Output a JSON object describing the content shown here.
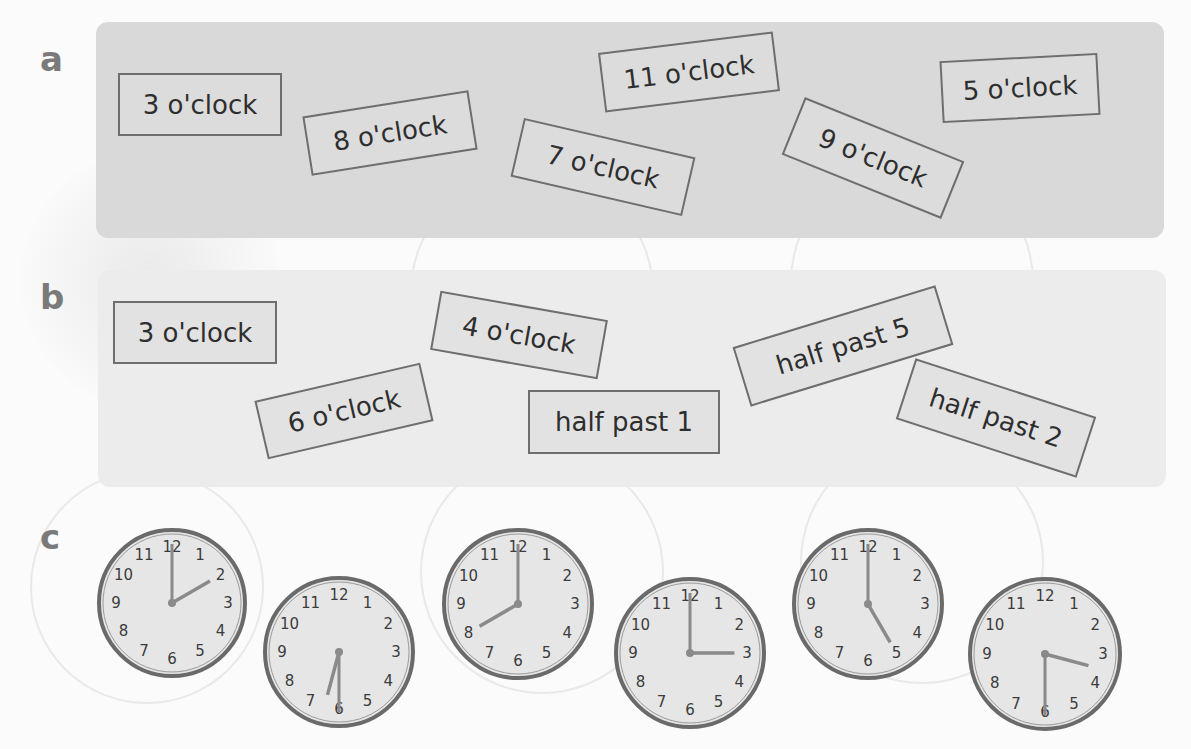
{
  "sections": {
    "a": {
      "letter": "a",
      "cards": [
        {
          "label": "3 o'clock",
          "x": 118,
          "y": 73,
          "w": 164,
          "h": 63,
          "rotate": 0
        },
        {
          "label": "8 o'clock",
          "x": 306,
          "y": 103,
          "w": 168,
          "h": 60,
          "rotate": -9
        },
        {
          "label": "11 o'clock",
          "x": 601,
          "y": 42,
          "w": 176,
          "h": 60,
          "rotate": -7
        },
        {
          "label": "7 o'clock",
          "x": 515,
          "y": 137,
          "w": 176,
          "h": 60,
          "rotate": 13
        },
        {
          "label": "9 o'clock",
          "x": 787,
          "y": 127,
          "w": 172,
          "h": 62,
          "rotate": 22
        },
        {
          "label": "5 o'clock",
          "x": 941,
          "y": 57,
          "w": 158,
          "h": 62,
          "rotate": -3
        }
      ]
    },
    "b": {
      "letter": "b",
      "cards": [
        {
          "label": "3 o'clock",
          "x": 113,
          "y": 301,
          "w": 164,
          "h": 63,
          "rotate": 0
        },
        {
          "label": "4 o'clock",
          "x": 434,
          "y": 305,
          "w": 170,
          "h": 60,
          "rotate": 10
        },
        {
          "label": "6 o'clock",
          "x": 259,
          "y": 381,
          "w": 170,
          "h": 60,
          "rotate": -13
        },
        {
          "label": "half past 1",
          "x": 528,
          "y": 390,
          "w": 192,
          "h": 64,
          "rotate": 0
        },
        {
          "label": "half past 5",
          "x": 737,
          "y": 315,
          "w": 212,
          "h": 62,
          "rotate": -17
        },
        {
          "label": "half past 2",
          "x": 901,
          "y": 386,
          "w": 190,
          "h": 64,
          "rotate": 18
        }
      ]
    },
    "c": {
      "letter": "c",
      "clocks": [
        {
          "time": "2:00",
          "hour": 2,
          "minute": 0,
          "cx": 172,
          "cy": 603,
          "r": 73
        },
        {
          "time": "6:30",
          "hour": 6,
          "minute": 30,
          "cx": 339,
          "cy": 652,
          "r": 74
        },
        {
          "time": "8:00",
          "hour": 8,
          "minute": 0,
          "cx": 518,
          "cy": 604,
          "r": 74
        },
        {
          "time": "3:00",
          "hour": 3,
          "minute": 0,
          "cx": 690,
          "cy": 653,
          "r": 74
        },
        {
          "time": "5:00",
          "hour": 5,
          "minute": 0,
          "cx": 868,
          "cy": 604,
          "r": 74
        },
        {
          "time": "3:30",
          "hour": 3,
          "minute": 30,
          "cx": 1045,
          "cy": 654,
          "r": 75
        }
      ],
      "numerals": [
        "12",
        "1",
        "2",
        "3",
        "4",
        "5",
        "6",
        "7",
        "8",
        "9",
        "10",
        "11"
      ]
    }
  },
  "colors": {
    "panel_a_bg": "#d9d9d9",
    "panel_b_bg": "#ececec",
    "card_border": "#6e6e6e",
    "card_text": "#2e2e2e",
    "letter": "#7a7a7a",
    "clock_rim": "#6a6a6a",
    "clock_face": "#e6e6e6",
    "clock_hand": "#8a8a8a"
  }
}
